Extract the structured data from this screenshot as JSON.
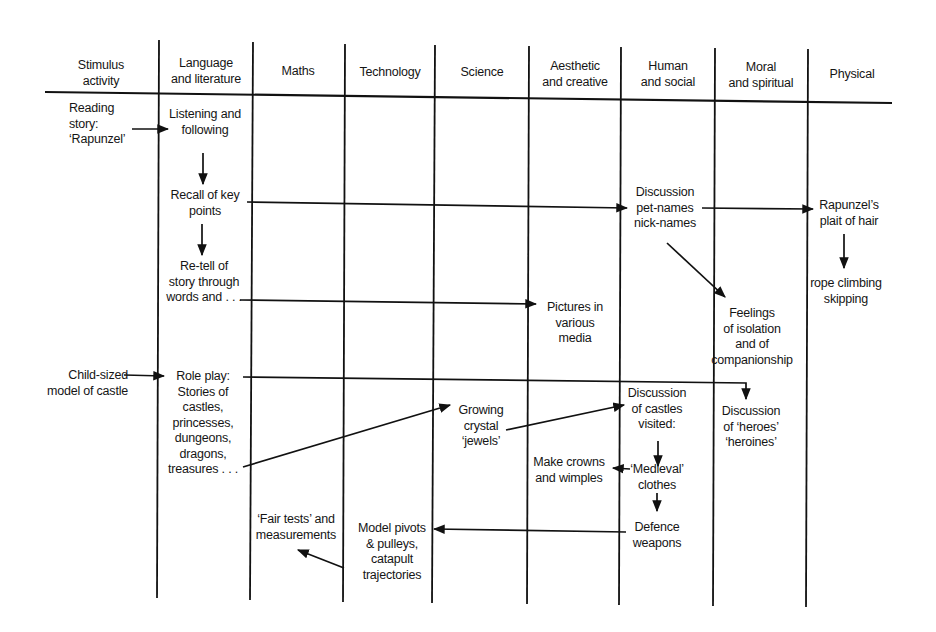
{
  "diagram": {
    "type": "curriculum cross-curricular flow chart",
    "columns": [
      {
        "id": "stimulus",
        "label": "Stimulus\nactivity"
      },
      {
        "id": "language",
        "label": "Language\nand literature"
      },
      {
        "id": "maths",
        "label": "Maths"
      },
      {
        "id": "technology",
        "label": "Technology"
      },
      {
        "id": "science",
        "label": "Science"
      },
      {
        "id": "aesthetic",
        "label": "Aesthetic\nand creative"
      },
      {
        "id": "human",
        "label": "Human\nand social"
      },
      {
        "id": "moral",
        "label": "Moral\nand spiritual"
      },
      {
        "id": "physical",
        "label": "Physical"
      }
    ],
    "nodes": [
      {
        "id": "reading",
        "column": "stimulus",
        "text": "Reading\nstory:\n‘Rapunzel’"
      },
      {
        "id": "listening",
        "column": "language",
        "text": "Listening and\nfollowing"
      },
      {
        "id": "recall",
        "column": "language",
        "text": "Recall of key\npoints"
      },
      {
        "id": "retell",
        "column": "language",
        "text": "Re-tell of\nstory through\nwords and . . ."
      },
      {
        "id": "discussion-names",
        "column": "human",
        "text": "Discussion\npet-names\nnick-names"
      },
      {
        "id": "plait",
        "column": "physical",
        "text": "Rapunzel’s\nplait of hair"
      },
      {
        "id": "rope",
        "column": "physical",
        "text": "rope climbing\nskipping"
      },
      {
        "id": "pictures",
        "column": "aesthetic",
        "text": "Pictures in\nvarious\nmedia"
      },
      {
        "id": "feelings",
        "column": "moral",
        "text": "Feelings\nof isolation\nand of\ncompanionship"
      },
      {
        "id": "castle-model",
        "column": "stimulus",
        "text": "Child-sized\nmodel of castle"
      },
      {
        "id": "roleplay",
        "column": "language",
        "text": "Role play:\nStories of\ncastles,\nprincesses,\ndungeons,\ndragons,\ntreasures . . ."
      },
      {
        "id": "crystals",
        "column": "science",
        "text": "Growing\ncrystal\n‘jewels’"
      },
      {
        "id": "castles-visited",
        "column": "human",
        "text": "Discussion\nof castles\nvisited:"
      },
      {
        "id": "heroes",
        "column": "moral",
        "text": "Discussion\nof ‘heroes’\n‘heroines’"
      },
      {
        "id": "crowns",
        "column": "aesthetic",
        "text": "Make crowns\nand wimples"
      },
      {
        "id": "medieval",
        "column": "human",
        "text": "‘Medieval’\nclothes"
      },
      {
        "id": "defence",
        "column": "human",
        "text": "Defence\nweapons"
      },
      {
        "id": "pivots",
        "column": "technology",
        "text": "Model pivots\n& pulleys,\ncatapult\ntrajectories"
      },
      {
        "id": "fair-tests",
        "column": "maths",
        "text": "‘Fair tests’ and\nmeasurements"
      }
    ],
    "edges": [
      {
        "from": "reading",
        "to": "listening"
      },
      {
        "from": "listening",
        "to": "recall"
      },
      {
        "from": "recall",
        "to": "retell"
      },
      {
        "from": "recall",
        "to": "discussion-names"
      },
      {
        "from": "discussion-names",
        "to": "plait"
      },
      {
        "from": "plait",
        "to": "rope"
      },
      {
        "from": "discussion-names",
        "to": "feelings"
      },
      {
        "from": "retell",
        "to": "pictures"
      },
      {
        "from": "castle-model",
        "to": "roleplay"
      },
      {
        "from": "roleplay",
        "to": "heroes"
      },
      {
        "from": "roleplay",
        "to": "crystals"
      },
      {
        "from": "crystals",
        "to": "castles-visited"
      },
      {
        "from": "castles-visited",
        "to": "medieval"
      },
      {
        "from": "medieval",
        "to": "crowns"
      },
      {
        "from": "medieval",
        "to": "defence"
      },
      {
        "from": "defence",
        "to": "pivots"
      },
      {
        "from": "pivots",
        "to": "fair-tests"
      }
    ]
  }
}
